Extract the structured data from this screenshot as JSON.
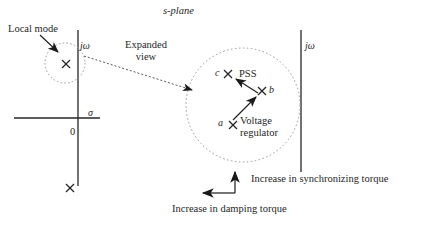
{
  "figure": {
    "title": "s-plane"
  },
  "labels": {
    "s_plane": "s-plane",
    "local_mode": "Local mode",
    "j_omega_left": "jω",
    "j_omega_right": "jω",
    "expanded_view_line1": "Expanded",
    "expanded_view_line2": "view",
    "sigma": "σ",
    "origin": "0",
    "point_c": "c",
    "point_b": "b",
    "point_a": "a",
    "pss": "PSS",
    "voltage_regulator_line1": "Voltage",
    "voltage_regulator_line2": "regulator",
    "increase_synchronizing_torque": "Increase in synchronizing torque",
    "increase_damping_torque": "Increase in damping torque"
  },
  "markers": {
    "local_mode_pole": "x-marker",
    "lower_pole": "x-marker",
    "pole_a": "x-marker",
    "pole_b": "x-marker",
    "pole_c": "x-marker"
  },
  "colors": {
    "stroke": "#262626",
    "dashed": "#9a9a9a",
    "text": "#262626",
    "background": "#ffffff"
  }
}
